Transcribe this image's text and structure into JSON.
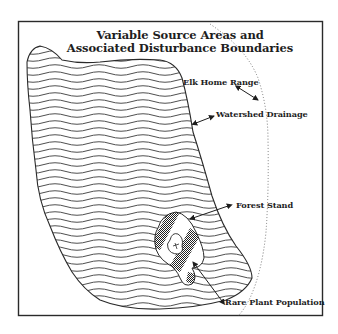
{
  "diagram": {
    "title_line1": "Variable Source Areas and",
    "title_line2": "Associated Disturbance Boundaries",
    "labels": {
      "elk_home_range": "Elk Home Range",
      "watershed_drainage": "Watershed Drainage",
      "forest_stand": "Forest Stand",
      "rare_plant_population": "Rare Plant Population"
    },
    "colors": {
      "ink": "#1e1e1e",
      "background": "#ffffff",
      "frame": "#2a2a2a",
      "dotted_boundary": "#6a6a6a"
    }
  }
}
